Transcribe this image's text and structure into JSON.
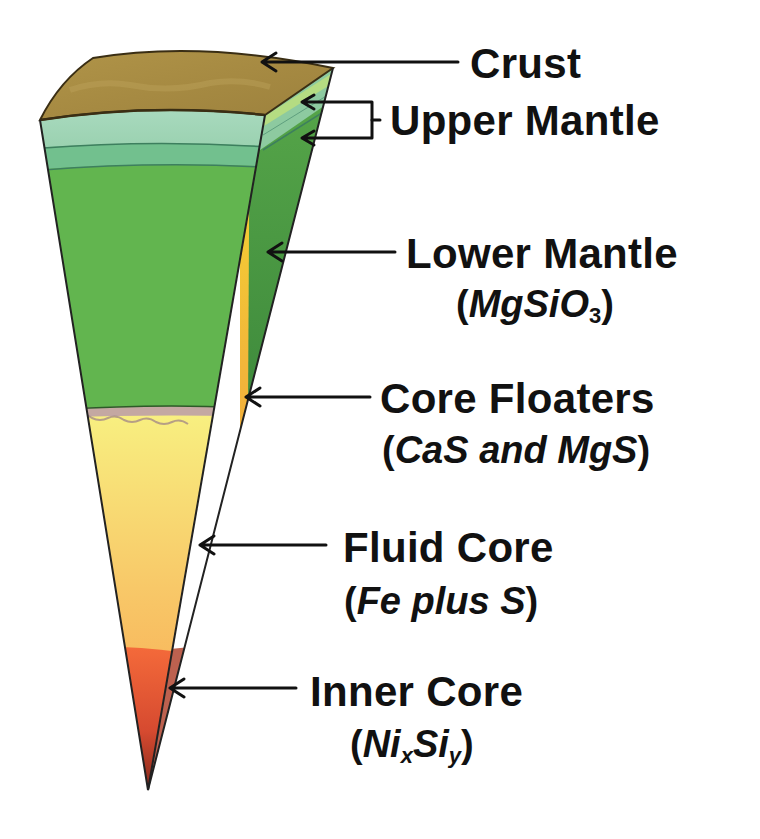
{
  "diagram": {
    "type": "earth-interior-wedge",
    "colors": {
      "crust": "#a88c45",
      "upper_mantle_light": "#9fd3b4",
      "upper_mantle_band": "#6cbf8f",
      "lower_mantle": "#5fb54d",
      "lower_mantle_side": "#3f8f3a",
      "core_floaters": "#b79a9a",
      "fluid_core_top": "#f7ee7a",
      "fluid_core_bottom": "#f7a24a",
      "inner_core_top": "#f26a3a",
      "inner_core_bottom": "#8a2a1a",
      "arrow": "#111111"
    },
    "layers": [
      {
        "id": "crust",
        "label": "Crust",
        "formula": null
      },
      {
        "id": "upper-mantle",
        "label": "Upper Mantle",
        "formula": null
      },
      {
        "id": "lower-mantle",
        "label": "Lower Mantle",
        "formula_parts": [
          "(",
          "MgSiO",
          "3",
          ")"
        ]
      },
      {
        "id": "core-floaters",
        "label": "Core Floaters",
        "formula_parts": [
          "(",
          "CaS and MgS",
          ")"
        ]
      },
      {
        "id": "fluid-core",
        "label": "Fluid Core",
        "formula_parts": [
          "(",
          "Fe plus S",
          ")"
        ]
      },
      {
        "id": "inner-core",
        "label": "Inner Core",
        "formula_parts": [
          "(",
          "Ni",
          "x",
          "Si",
          "y",
          ")"
        ]
      }
    ]
  }
}
